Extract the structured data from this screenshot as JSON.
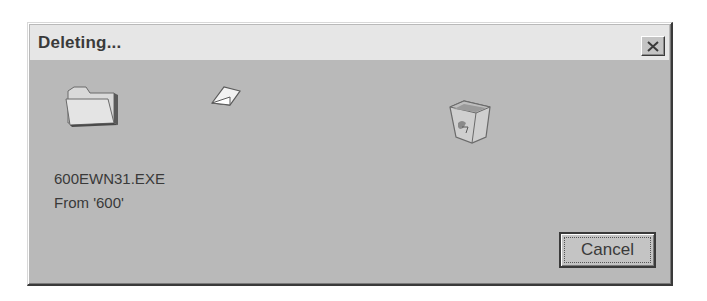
{
  "dialog": {
    "title": "Deleting...",
    "close_label": "Close",
    "file_name": "600EWN31.EXE",
    "from_text": "From '600'",
    "cancel_label": "Cancel"
  },
  "icons": {
    "source": "folder-icon",
    "flying": "paper-icon",
    "destination": "recycle-bin-icon",
    "close": "close-icon"
  },
  "colors": {
    "titlebar": "#e6e6e6",
    "body": "#b9b9b9",
    "text": "#3a3a3a"
  }
}
